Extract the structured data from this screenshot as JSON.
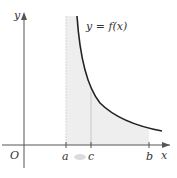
{
  "figure": {
    "curve_label": "y = f(x)",
    "axis_labels": {
      "x": "x",
      "y": "y",
      "origin": "O"
    },
    "tick_labels": [
      "a",
      "c",
      "b"
    ],
    "colors": {
      "axis": "#555555",
      "curve": "#222222",
      "shade": "#eeeeee",
      "guide": "#cccccc",
      "arrow_hint": "#dcdcdc"
    }
  }
}
